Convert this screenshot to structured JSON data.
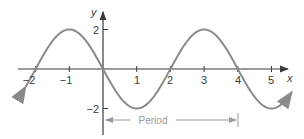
{
  "chart_data": {
    "type": "line",
    "title": "",
    "function": "y = -2 sin(pi x / 2)",
    "xlabel": "x",
    "ylabel": "y",
    "xlim": [
      -2.3,
      5.6
    ],
    "ylim": [
      -2,
      2
    ],
    "x_ticks": [
      -2,
      -1,
      1,
      2,
      3,
      4,
      5
    ],
    "x_tick_labels": [
      "−2",
      "−1",
      "1",
      "2",
      "3",
      "4",
      "5"
    ],
    "y_ticks": [
      2,
      -2
    ],
    "y_tick_labels": [
      "2",
      "−2"
    ],
    "series": [
      {
        "name": "curve",
        "x": [
          -2,
          -1,
          0,
          1,
          2,
          3,
          4,
          5
        ],
        "y": [
          0,
          2,
          0,
          -2,
          0,
          2,
          0,
          -2
        ]
      }
    ],
    "annotations": [
      {
        "text": "Period",
        "from_x": 0,
        "to_x": 4
      }
    ],
    "grid": false,
    "colors": {
      "curve": "#8a8a8a",
      "axes": "#3a3a3a",
      "period": "#9a9a9a"
    }
  }
}
